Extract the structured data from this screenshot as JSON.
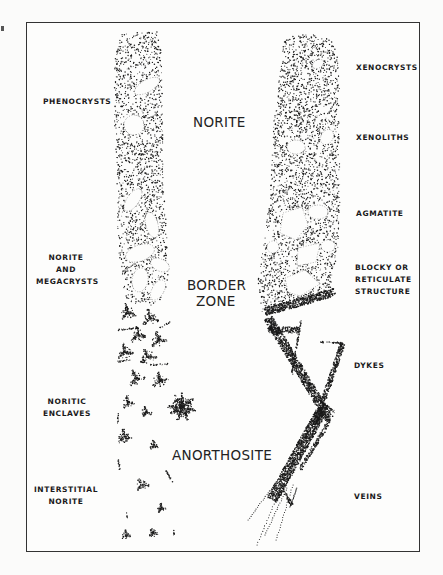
{
  "figure": {
    "type": "geological-schematic",
    "zones": {
      "norite": "NORITE",
      "border_zone_line1": "BORDER",
      "border_zone_line2": "ZONE",
      "anorthosite": "ANORTHOSITE"
    },
    "left_column_labels": [
      {
        "lines": [
          "PHENOCRYSTS"
        ]
      },
      {
        "lines": [
          "NORITE",
          "AND",
          "MEGACRYSTS"
        ]
      },
      {
        "lines": [
          "NORITIC",
          "ENCLAVES"
        ]
      },
      {
        "lines": [
          "INTERSTITIAL",
          "NORITE"
        ]
      }
    ],
    "right_column_labels": [
      {
        "lines": [
          "XENOCRYSTS"
        ]
      },
      {
        "lines": [
          "XENOLITHS"
        ]
      },
      {
        "lines": [
          "AGMATITE"
        ]
      },
      {
        "lines": [
          "BLOCKY OR",
          "RETICULATE",
          "STRUCTURE"
        ]
      },
      {
        "lines": [
          "DYKES"
        ]
      },
      {
        "lines": [
          "VEINS"
        ]
      }
    ],
    "colors": {
      "ink": "#1a1a1a",
      "paper": "#fdfdfc"
    }
  }
}
